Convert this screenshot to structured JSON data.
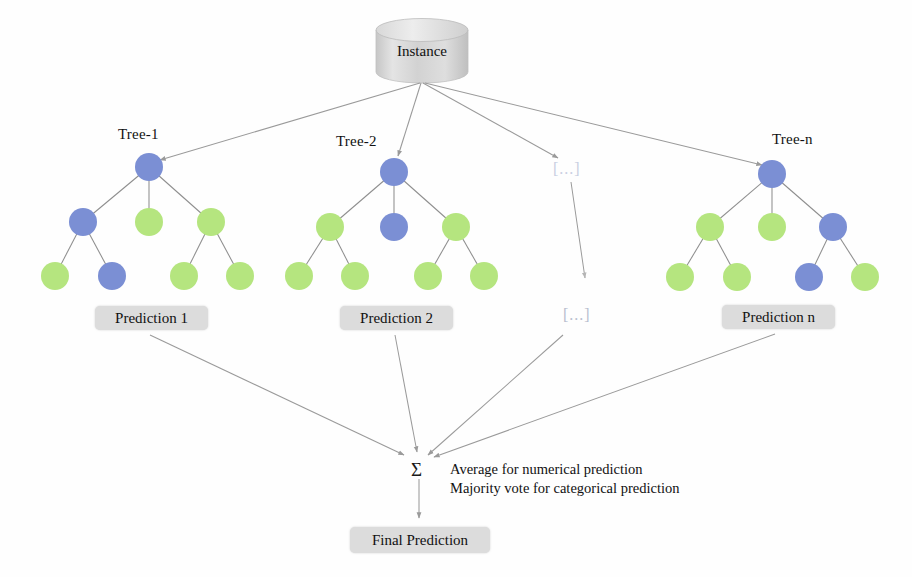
{
  "diagram": {
    "background": "#fefefe"
  },
  "colors": {
    "node_blue": "#7b8fd4",
    "node_green": "#b5e57f",
    "box_gray": "#dcdcdc",
    "arrow_gray": "#9a9a9a",
    "edge_gray": "#8e8e8e",
    "cylinder_gray": "#d4d4d4",
    "ellipsis_blue_gray": "#c9cfe2",
    "text_black": "#111111"
  },
  "source": {
    "label": "Instance",
    "shape": "cylinder"
  },
  "trees": [
    {
      "title": "Tree-1",
      "root": {
        "color": "blue",
        "cx": 149,
        "cy": 167,
        "r": 14
      },
      "level2": [
        {
          "color": "blue",
          "cx": 83,
          "cy": 222,
          "r": 14
        },
        {
          "color": "green",
          "cx": 149,
          "cy": 222,
          "r": 14
        },
        {
          "color": "green",
          "cx": 211,
          "cy": 222,
          "r": 14
        }
      ],
      "leaves": [
        {
          "color": "green",
          "cx": 55,
          "cy": 276,
          "r": 14
        },
        {
          "color": "blue",
          "cx": 112,
          "cy": 276,
          "r": 14
        },
        {
          "color": "green",
          "cx": 184,
          "cy": 276,
          "r": 14
        },
        {
          "color": "green",
          "cx": 240,
          "cy": 276,
          "r": 14
        }
      ],
      "prediction": {
        "label": "Prediction 1",
        "x": 95,
        "y": 306,
        "w": 113,
        "h": 24
      }
    },
    {
      "title": "Tree-2",
      "root": {
        "color": "blue",
        "cx": 394,
        "cy": 172,
        "r": 14
      },
      "level2": [
        {
          "color": "green",
          "cx": 330,
          "cy": 227,
          "r": 14
        },
        {
          "color": "blue",
          "cx": 394,
          "cy": 227,
          "r": 14
        },
        {
          "color": "green",
          "cx": 456,
          "cy": 227,
          "r": 14
        }
      ],
      "leaves": [
        {
          "color": "green",
          "cx": 299,
          "cy": 276,
          "r": 14
        },
        {
          "color": "green",
          "cx": 355,
          "cy": 276,
          "r": 14
        },
        {
          "color": "green",
          "cx": 428,
          "cy": 276,
          "r": 14
        },
        {
          "color": "green",
          "cx": 484,
          "cy": 276,
          "r": 14
        }
      ],
      "prediction": {
        "label": "Prediction 2",
        "x": 340,
        "y": 306,
        "w": 113,
        "h": 24
      }
    },
    {
      "title": "Tree-n",
      "root": {
        "color": "blue",
        "cx": 772,
        "cy": 174,
        "r": 14
      },
      "level2": [
        {
          "color": "green",
          "cx": 710,
          "cy": 227,
          "r": 14
        },
        {
          "color": "green",
          "cx": 772,
          "cy": 227,
          "r": 14
        },
        {
          "color": "blue",
          "cx": 833,
          "cy": 227,
          "r": 14
        }
      ],
      "leaves": [
        {
          "color": "green",
          "cx": 680,
          "cy": 277,
          "r": 14
        },
        {
          "color": "green",
          "cx": 737,
          "cy": 277,
          "r": 14
        },
        {
          "color": "blue",
          "cx": 809,
          "cy": 277,
          "r": 14
        },
        {
          "color": "green",
          "cx": 865,
          "cy": 277,
          "r": 14
        }
      ],
      "prediction": {
        "label": "Prediction n",
        "x": 722,
        "y": 305,
        "w": 113,
        "h": 24
      }
    }
  ],
  "placeholders": {
    "tree_slot": "[...]",
    "prediction_slot": "[...]"
  },
  "aggregator": {
    "symbol": "Σ",
    "line1": "Average for numerical prediction",
    "line2": "Majority vote for categorical prediction"
  },
  "final": {
    "label": "Final Prediction"
  },
  "tree_titles": {
    "t1": "Tree-1",
    "t2": "Tree-2",
    "tn": "Tree-n"
  }
}
